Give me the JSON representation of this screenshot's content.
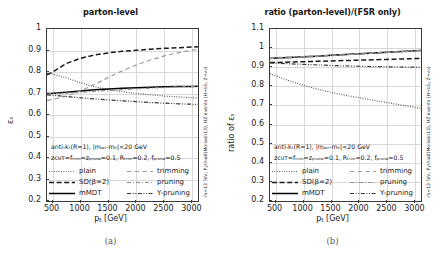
{
  "figure": {
    "sidenote": "√s=13 TeV, Pythia8(Monash13), HZ events (H→bb̄, Z→νν)",
    "xlabel_main": "p",
    "xlabel_sub": "t",
    "xlabel_unit": " [GeV]"
  },
  "panels": [
    {
      "id": "a",
      "caption": "(a)",
      "title": "parton-level",
      "ylabel": "εₛ",
      "annotation_line1": "anti-kₜ(R=1), |mⱼₑₜ-mₕ|<20 GeV",
      "annotation_line2": "zᴄᴜᴛ=fₜᵣᵢₘ=zₚᵣᵤₙₑ=0.1, Rₜᵣᵢₘ=0.2, fₚᵣᵤₙₑ=0.5",
      "yticks": [
        "1",
        "0.9",
        "0.8",
        "0.7",
        "0.6",
        "0.5",
        "0.4",
        "0.3",
        "0.2"
      ],
      "xticks": [
        "500",
        "1000",
        "1500",
        "2000",
        "2500",
        "3000"
      ]
    },
    {
      "id": "b",
      "caption": "(b)",
      "title": "ratio (parton-level)/(FSR only)",
      "ylabel": "ratio of εₛ",
      "annotation_line1": "anti-kₜ(R=1), |mⱼₑₜ-mₕ|<20 GeV",
      "annotation_line2": "zᴄᴜᴛ=fₜᵣᵢₘ=zₚᵣᵤₙₑ=0.1, Rₜᵣᵢₘ=0.2, fₚᵣᵤₙₑ=0.5",
      "yticks": [
        "1.1",
        "1",
        "0.9",
        "0.8",
        "0.7",
        "0.6",
        "0.5",
        "0.4",
        "0.3",
        "0.2"
      ],
      "xticks": [
        "500",
        "1000",
        "1500",
        "2000",
        "2500",
        "3000"
      ]
    }
  ],
  "legend": {
    "items": [
      {
        "label": "plain",
        "style": "dotted",
        "color": "#555555",
        "col": 0,
        "row": 0
      },
      {
        "label": "SD(β=2)",
        "style": "dashed",
        "color": "#1a1a1a",
        "col": 0,
        "row": 1
      },
      {
        "label": "mMDT",
        "style": "solid",
        "color": "#000000",
        "col": 0,
        "row": 2
      },
      {
        "label": "trimming",
        "style": "dashed-light",
        "color": "#9a9a9a",
        "col": 1,
        "row": 0
      },
      {
        "label": "pruning",
        "style": "dashdot-light",
        "color": "#8e8e8e",
        "col": 1,
        "row": 1
      },
      {
        "label": "Y-pruning",
        "style": "dashdotdot",
        "color": "#3a3a3a",
        "col": 1,
        "row": 2
      }
    ]
  },
  "chart_data": [
    {
      "type": "line",
      "panel": "a",
      "title": "parton-level",
      "xlabel": "p_t [GeV]",
      "ylabel": "ε_S",
      "xlim": [
        400,
        3100
      ],
      "ylim": [
        0.2,
        1.0
      ],
      "grid": true,
      "legend_position": "lower-center",
      "x": [
        400,
        500,
        750,
        1000,
        1250,
        1500,
        1750,
        2000,
        2250,
        2500,
        2750,
        3000,
        3100
      ],
      "series": [
        {
          "name": "plain",
          "values": [
            0.793,
            0.79,
            0.772,
            0.75,
            0.731,
            0.718,
            0.708,
            0.7,
            0.694,
            0.688,
            0.684,
            0.68,
            0.679
          ]
        },
        {
          "name": "SD(β=2)",
          "values": [
            0.787,
            0.8,
            0.84,
            0.864,
            0.879,
            0.889,
            0.896,
            0.901,
            0.906,
            0.91,
            0.913,
            0.916,
            0.917
          ]
        },
        {
          "name": "mMDT",
          "values": [
            0.7,
            0.701,
            0.706,
            0.712,
            0.717,
            0.721,
            0.724,
            0.727,
            0.729,
            0.731,
            0.732,
            0.733,
            0.734
          ]
        },
        {
          "name": "trimming",
          "values": [
            0.668,
            0.672,
            0.688,
            0.712,
            0.742,
            0.775,
            0.806,
            0.833,
            0.856,
            0.875,
            0.89,
            0.902,
            0.906
          ]
        },
        {
          "name": "pruning",
          "values": [
            0.7,
            0.7,
            0.702,
            0.706,
            0.71,
            0.714,
            0.718,
            0.722,
            0.725,
            0.728,
            0.731,
            0.733,
            0.734
          ]
        },
        {
          "name": "Y-pruning",
          "values": [
            0.694,
            0.692,
            0.686,
            0.68,
            0.675,
            0.67,
            0.666,
            0.662,
            0.658,
            0.655,
            0.652,
            0.65,
            0.649
          ]
        }
      ]
    },
    {
      "type": "line",
      "panel": "b",
      "title": "ratio (parton-level)/(FSR only)",
      "xlabel": "p_t [GeV]",
      "ylabel": "ratio of ε_S",
      "xlim": [
        400,
        3100
      ],
      "ylim": [
        0.2,
        1.1
      ],
      "grid": true,
      "legend_position": "lower-center",
      "x": [
        400,
        500,
        750,
        1000,
        1250,
        1500,
        1750,
        2000,
        2250,
        2500,
        2750,
        3000,
        3100
      ],
      "series": [
        {
          "name": "plain",
          "values": [
            0.865,
            0.856,
            0.828,
            0.805,
            0.785,
            0.768,
            0.753,
            0.74,
            0.727,
            0.715,
            0.702,
            0.69,
            0.685
          ]
        },
        {
          "name": "SD(β=2)",
          "values": [
            0.925,
            0.925,
            0.927,
            0.929,
            0.931,
            0.933,
            0.935,
            0.937,
            0.939,
            0.941,
            0.943,
            0.945,
            0.946
          ]
        },
        {
          "name": "mMDT",
          "values": [
            0.947,
            0.948,
            0.951,
            0.955,
            0.958,
            0.962,
            0.966,
            0.97,
            0.974,
            0.978,
            0.982,
            0.986,
            0.987
          ]
        },
        {
          "name": "trimming",
          "values": [
            0.95,
            0.951,
            0.953,
            0.956,
            0.959,
            0.963,
            0.967,
            0.971,
            0.975,
            0.979,
            0.983,
            0.987,
            0.988
          ]
        },
        {
          "name": "pruning",
          "values": [
            0.946,
            0.947,
            0.95,
            0.954,
            0.957,
            0.961,
            0.965,
            0.969,
            0.973,
            0.977,
            0.981,
            0.985,
            0.986
          ]
        },
        {
          "name": "Y-pruning",
          "values": [
            0.922,
            0.921,
            0.918,
            0.915,
            0.912,
            0.909,
            0.907,
            0.905,
            0.903,
            0.902,
            0.901,
            0.9,
            0.9
          ]
        }
      ]
    }
  ]
}
